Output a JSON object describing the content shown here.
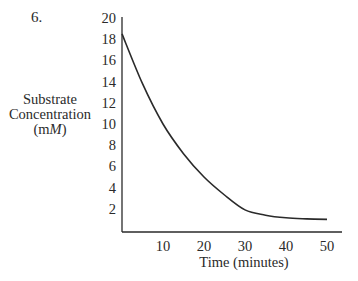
{
  "problem_number": "6.",
  "chart_data": {
    "type": "line",
    "title": "",
    "xlabel": "Time (minutes)",
    "ylabel": "Substrate Concentration (mM)",
    "ylabel_lines": [
      "Substrate",
      "Concentration",
      "(m",
      "M",
      ")"
    ],
    "x_ticks": [
      10,
      20,
      30,
      40,
      50
    ],
    "y_ticks": [
      2,
      4,
      6,
      8,
      10,
      12,
      14,
      16,
      18,
      20
    ],
    "xlim": [
      0,
      53
    ],
    "ylim": [
      0,
      20
    ],
    "grid": false,
    "legend": null,
    "series": [
      {
        "name": "Substrate concentration",
        "x": [
          0,
          5,
          10,
          15,
          20,
          25,
          30,
          35,
          40,
          45,
          50
        ],
        "values": [
          18.5,
          13.8,
          10.0,
          7.2,
          5.0,
          3.3,
          1.9,
          1.4,
          1.15,
          1.05,
          1.0
        ]
      }
    ],
    "colors": {
      "line": "#2a2a2a",
      "axis": "#2a2a2a"
    }
  }
}
